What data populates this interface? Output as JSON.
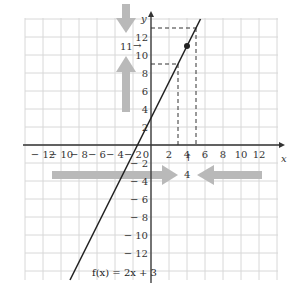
{
  "chart_data": {
    "type": "line",
    "title": "",
    "function_label": "f(x) = 2x + 3",
    "xlabel": "x",
    "ylabel": "y",
    "xlim": [
      -14,
      14
    ],
    "ylim": [
      -14,
      14
    ],
    "grid": true,
    "x_ticks": [
      "-12",
      "-10",
      "-8",
      "-6",
      "-4",
      "-2",
      "0",
      "2",
      "4",
      "6",
      "8",
      "10",
      "12"
    ],
    "y_ticks": [
      "12",
      "10",
      "8",
      "6",
      "4",
      "2",
      "-2",
      "-4",
      "-6",
      "-8",
      "-10",
      "-12"
    ],
    "series": [
      {
        "name": "f(x) = 2x + 3",
        "slope": 2,
        "intercept": 3,
        "x": [
          -9,
          5.5
        ],
        "y": [
          -15,
          14
        ]
      }
    ],
    "highlighted_point": {
      "x": 4,
      "y": 11
    },
    "dashed_bounds": {
      "x": [
        3,
        5
      ],
      "y": [
        9,
        13
      ]
    },
    "annotations": [
      {
        "text": "11",
        "arrow": "→",
        "position": "y-axis at 11"
      },
      {
        "text": "4",
        "arrow": "↑",
        "position": "x-axis at 4"
      }
    ],
    "arrows": [
      {
        "direction": "down",
        "axis": "y",
        "note": "approaching 11 from above"
      },
      {
        "direction": "up",
        "axis": "y",
        "note": "approaching 11 from below"
      },
      {
        "direction": "right",
        "axis": "x",
        "note": "approaching 4 from left"
      },
      {
        "direction": "left",
        "axis": "x",
        "note": "approaching 4 from right"
      }
    ],
    "colors": {
      "line": "#222222",
      "grid": "#d8d8d8",
      "arrow": "#b9b9b9"
    }
  },
  "labels": {
    "x_axis": "x",
    "y_axis": "y",
    "func": "f(x) = 2x + 3",
    "y_value": "11",
    "y_arrow": "→",
    "x_value": "4",
    "x_arrow": "↑"
  }
}
